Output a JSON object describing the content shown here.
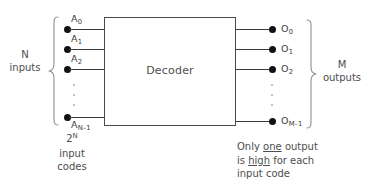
{
  "diagram": {
    "block": {
      "label": "Decoder"
    },
    "left_annotation": {
      "line1": "N",
      "line2": "inputs"
    },
    "left_bottom_annotation": {
      "line1_base": "2",
      "line1_sup": "N",
      "line2": "input",
      "line3": "codes"
    },
    "right_annotation": {
      "line1": "M",
      "line2": "outputs"
    },
    "note": {
      "part1": "Only ",
      "emph1": "one",
      "part2": " output",
      "part3": "is ",
      "emph2": "high",
      "part4": " for each",
      "part5": "input code"
    },
    "inputs": [
      {
        "base": "A",
        "sub": "0"
      },
      {
        "base": "A",
        "sub": "1"
      },
      {
        "base": "A",
        "sub": "2"
      },
      {
        "base": "A",
        "sub": "N–1"
      }
    ],
    "outputs": [
      {
        "base": "O",
        "sub": "0"
      },
      {
        "base": "O",
        "sub": "1"
      },
      {
        "base": "O",
        "sub": "2"
      },
      {
        "base": "O",
        "sub": "M–1"
      }
    ],
    "colors": {
      "wire": "#3a3a3a",
      "dot": "#111111",
      "box_border": "#4a4a4a",
      "text": "#4d4d4d",
      "brace": "#8e8e8e",
      "background": "#ffffff"
    }
  }
}
